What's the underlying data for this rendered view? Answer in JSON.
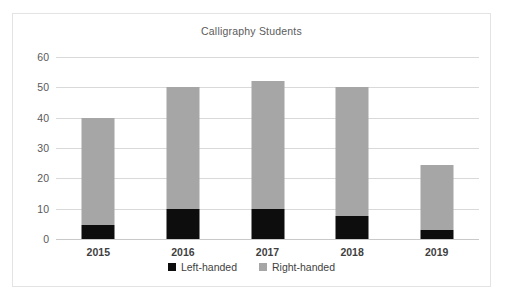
{
  "chart_data": {
    "type": "bar",
    "subtype": "stacked-vertical-bar",
    "title": "Calligraphy Students",
    "xlabel": "",
    "ylabel": "",
    "categories": [
      "2015",
      "2016",
      "2017",
      "2018",
      "2019"
    ],
    "series": [
      {
        "name": "Left-handed",
        "color": "#0d0d0d",
        "values": [
          4.5,
          10,
          10,
          7.5,
          3
        ]
      },
      {
        "name": "Right-handed",
        "color": "#a6a6a6",
        "values": [
          35.5,
          40,
          42,
          42.5,
          21.5
        ]
      }
    ],
    "totals": [
      40,
      50,
      52,
      50,
      24.5
    ],
    "ylim": [
      0,
      60
    ],
    "yticks": [
      0,
      10,
      20,
      30,
      40,
      50,
      60
    ],
    "ytick_labels": [
      "0",
      "10",
      "20",
      "30",
      "40",
      "50",
      "60"
    ],
    "grid": true,
    "grid_axis": "y",
    "legend_position": "bottom",
    "legend_entries": [
      "Left-handed",
      "Right-handed"
    ]
  },
  "style": {
    "plot_background": "#ffffff",
    "border_color": "#e3e3e3",
    "gridline_color": "#d9d9d9",
    "title_color": "#5b5b5b",
    "tick_color": "#595959"
  }
}
